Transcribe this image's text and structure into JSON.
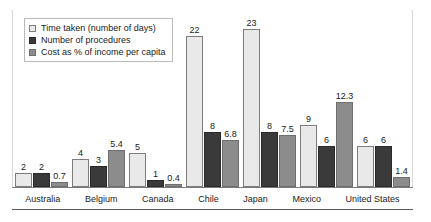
{
  "chart_data": {
    "type": "bar",
    "title": "",
    "subtitle": "",
    "xlabel": "",
    "ylabel": "",
    "ylim": [
      0,
      24
    ],
    "grid": false,
    "legend_position": "top-left",
    "categories": [
      "Australia",
      "Belgium",
      "Canada",
      "Chile",
      "Japan",
      "Mexico",
      "United States"
    ],
    "series": [
      {
        "name": "Time taken (number of days)",
        "color": "#e9e9e9",
        "values": [
          2,
          4,
          5,
          22,
          23,
          9,
          6
        ],
        "labels": [
          "2",
          "4",
          "5",
          "22",
          "23",
          "9",
          "6"
        ]
      },
      {
        "name": "Number of procedures",
        "color": "#3a3a3a",
        "values": [
          2,
          3,
          1,
          8,
          8,
          6,
          6
        ],
        "labels": [
          "2",
          "3",
          "1",
          "8",
          "8",
          "6",
          "6"
        ]
      },
      {
        "name": "Cost as % of income per capita",
        "color": "#8c8c8c",
        "values": [
          0.7,
          5.4,
          0.4,
          6.8,
          7.5,
          12.3,
          1.4
        ],
        "labels": [
          "0.7",
          "5.4",
          "0.4",
          "6.8",
          "7.5",
          "12.3",
          "1.4"
        ]
      }
    ]
  }
}
